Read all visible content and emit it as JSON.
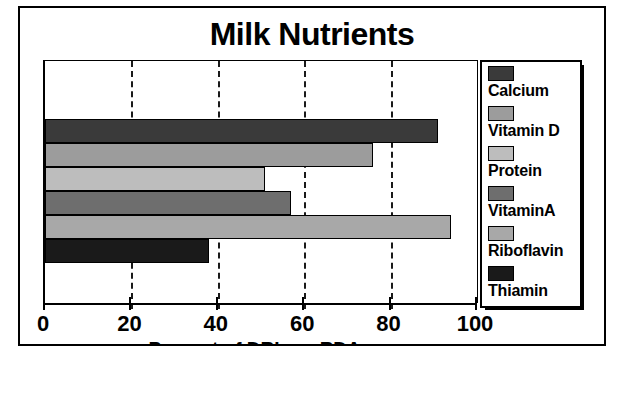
{
  "figure": {
    "title": "Milk Nutrients",
    "background": "#ffffff",
    "frame_color": "#000000"
  },
  "chart_data": {
    "type": "bar",
    "orientation": "horizontal",
    "title": "Milk Nutrients",
    "xlabel": "Percent of DRIs or RDAs",
    "ylabel": "",
    "xlim": [
      0,
      100
    ],
    "xticks": [
      0,
      20,
      40,
      60,
      80,
      100
    ],
    "xtick_labels": [
      "0",
      "20",
      "40",
      "60",
      "80",
      "100"
    ],
    "grid": "vertical-dashed",
    "legend_position": "right",
    "categories": [
      "Calcium",
      "Vitamin D",
      "Protein",
      "VitaminA",
      "Riboflavin",
      "Thiamin"
    ],
    "values": [
      91,
      76,
      51,
      57,
      94,
      38
    ],
    "colors": [
      "#3a3a3a",
      "#9c9c9c",
      "#bdbdbd",
      "#6e6e6e",
      "#a8a8a8",
      "#1a1a1a"
    ],
    "bars": [
      {
        "label": "Calcium",
        "value": 91,
        "color": "#3a3a3a"
      },
      {
        "label": "Vitamin D",
        "value": 76,
        "color": "#9c9c9c"
      },
      {
        "label": "Protein",
        "value": 51,
        "color": "#bdbdbd"
      },
      {
        "label": "VitaminA",
        "value": 57,
        "color": "#6e6e6e"
      },
      {
        "label": "Riboflavin",
        "value": 94,
        "color": "#a8a8a8"
      },
      {
        "label": "Thiamin",
        "value": 38,
        "color": "#1a1a1a"
      }
    ]
  },
  "legend": {
    "items": [
      {
        "label": "Calcium",
        "color": "#3a3a3a"
      },
      {
        "label": "Vitamin D",
        "color": "#9c9c9c"
      },
      {
        "label": "Protein",
        "color": "#bdbdbd"
      },
      {
        "label": "VitaminA",
        "color": "#6e6e6e"
      },
      {
        "label": "Riboflavin",
        "color": "#a8a8a8"
      },
      {
        "label": "Thiamin",
        "color": "#1a1a1a"
      }
    ]
  }
}
